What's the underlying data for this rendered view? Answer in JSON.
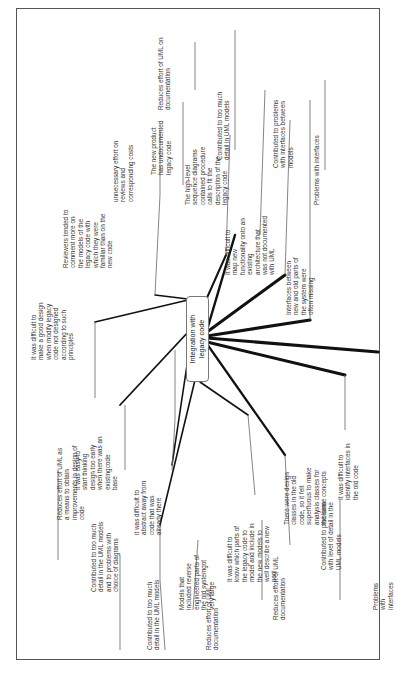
{
  "diagram": {
    "type": "mind-map",
    "orientation": "rotated-90-ccw",
    "center": {
      "label": "Integration with\nlegacy code"
    },
    "nodes": [
      {
        "id": "n1",
        "text": "It was difficult to\nmake a good design\nwhen modify legacy\ncode not designed\naccording to such\nprinciples"
      },
      {
        "id": "n2",
        "text": "Reduces effort of UML as\na means to obtain\nimprovements in design of\ncode"
      },
      {
        "id": "n3",
        "text": "Reviewers tended to\ncomment more on\nthe models of the\nlegacy code with\nwhich they were\nfamiliar than on the\nnew code"
      },
      {
        "id": "n4",
        "text": "unnecessary effort on\nreviews and\ncorresponding costs"
      },
      {
        "id": "n5",
        "text": "The new product\nhas undocumented\nlegacy code"
      },
      {
        "id": "n6",
        "text": "Reduces effort of UML on\ndocumentation"
      },
      {
        "id": "n7",
        "text": "The high-level\nsequence diagrams\ncontained procedure\ncalls to fit the\ndescription of the\nlegacy code"
      },
      {
        "id": "n8",
        "text": "Contributed to too much\ndetail in UML models"
      },
      {
        "id": "n9",
        "text": "It was difficult to\nmap new\nfunctionality onto an\nexisting\narchitecture that\nwas not documented\nwith UML"
      },
      {
        "id": "n10",
        "text": "Contributed to problems\nwith interfaces between\nmodels"
      },
      {
        "id": "n11",
        "text": "Interfaces between\nnew and old parts of\nthe system were\noften missing"
      },
      {
        "id": "n12",
        "text": "Problems with interfaces"
      },
      {
        "id": "n13",
        "text": "It was easy to\nstart thinking\ndesign too early\nwhen there was an\nexistingcode\nbase"
      },
      {
        "id": "n14",
        "text": "Contributed to too much\ndetail in the UML models\nand to problems with\nchoice of diagrams"
      },
      {
        "id": "n15",
        "text": "it was difficult to\nabstract away from\ncode that was\nalready there"
      },
      {
        "id": "n16",
        "text": "Contributed to too much\ndetail in the UML models"
      },
      {
        "id": "n17",
        "text": "Models that\nincluded reverse\nengineered parts of\nthe old systemgot\nvery large"
      },
      {
        "id": "n18",
        "text": "Reduces effort of UML\ndocumentation"
      },
      {
        "id": "n19",
        "text": "It was difficult to\nknow which parts of\nthe legacy code to\nmodel and include in\nthe new models to\nwell describe a new\npart"
      },
      {
        "id": "n20",
        "text": "Reduces effort of UML\ndocumentation"
      },
      {
        "id": "n21",
        "text": "There were design\nclasses in the old\ncode, so it felt\nsuperfluous to make\nanalysis classes for\nthe same concepts"
      },
      {
        "id": "n22",
        "text": "Contributed to problems\nwith level of detail in the\nUML models"
      },
      {
        "id": "n23",
        "text": "It was difficult to\nidentify interfaces in\nthe old code"
      },
      {
        "id": "n24",
        "text": "Problems with interfaces"
      }
    ]
  }
}
